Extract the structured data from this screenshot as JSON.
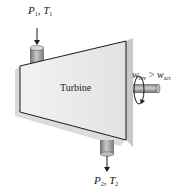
{
  "diagram": {
    "title": "Turbine",
    "inlet": {
      "pressure": "P",
      "pressure_sub": "1",
      "temperature": "T",
      "temperature_sub": "1"
    },
    "outlet": {
      "pressure": "P",
      "pressure_sub": "2",
      "temperature": "T",
      "temperature_sub": "2"
    },
    "work": {
      "left": "w",
      "left_sub": "rev",
      "operator": ">",
      "right": "w",
      "right_sub": "act"
    },
    "colors": {
      "body": "#ebebeb",
      "edge": "#1a1a1a",
      "shadow": "#cfcfcf",
      "pipe": "#9a9a9a"
    }
  }
}
